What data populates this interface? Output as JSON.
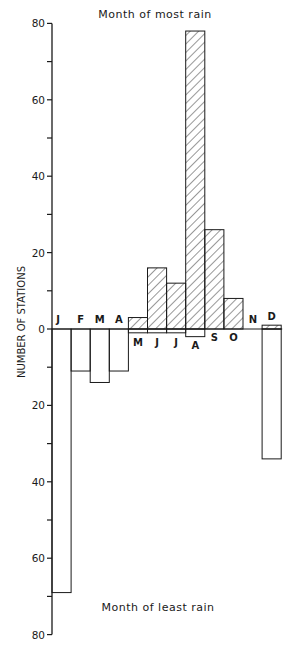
{
  "chart_data": {
    "type": "bar",
    "title_top": "Month of most rain",
    "title_bottom": "Month of least rain",
    "ylabel": "NUMBER OF STATIONS",
    "xlabel": "",
    "ylim": [
      -80,
      80
    ],
    "y_ticks_labeled": [
      80,
      60,
      40,
      20,
      0,
      20,
      40,
      60,
      80
    ],
    "y_tick_values": [
      80,
      70,
      60,
      50,
      40,
      30,
      20,
      10,
      0,
      -10,
      -20,
      -30,
      -40,
      -50,
      -60,
      -70,
      -80
    ],
    "grid": false,
    "legend": "none",
    "categories": [
      "J",
      "F",
      "M",
      "A",
      "M",
      "J",
      "J",
      "A",
      "S",
      "O",
      "N",
      "D"
    ],
    "category_full": [
      "January",
      "February",
      "March",
      "April",
      "May",
      "June",
      "July",
      "August",
      "September",
      "October",
      "November",
      "December"
    ],
    "series": [
      {
        "name": "Month of most rain",
        "style": "hatched",
        "values": [
          0,
          0,
          0,
          0,
          3,
          16,
          12,
          78,
          26,
          8,
          0,
          1
        ]
      },
      {
        "name": "Month of least rain",
        "style": "open",
        "values": [
          69,
          11,
          14,
          11,
          1,
          1,
          1,
          2,
          0,
          0,
          0,
          34
        ]
      }
    ],
    "month_label_position": [
      "above",
      "above",
      "above",
      "above",
      "below",
      "below",
      "below",
      "below",
      "below",
      "below",
      "above",
      "above"
    ]
  },
  "colors": {
    "ink": "#1a1a1a",
    "background": "#ffffff"
  }
}
